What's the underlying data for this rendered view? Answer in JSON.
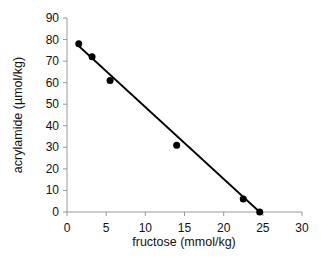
{
  "chart_data": {
    "type": "scatter",
    "title": "",
    "xlabel": "fructose (mmol/kg)",
    "ylabel": "acrylamide (µmol/kg)",
    "xlim": [
      0,
      30
    ],
    "ylim": [
      0,
      90
    ],
    "xticks": [
      0,
      5,
      10,
      15,
      20,
      25,
      30
    ],
    "yticks": [
      0,
      10,
      20,
      30,
      40,
      50,
      60,
      70,
      80,
      90
    ],
    "grid": false,
    "legend": null,
    "series": [
      {
        "name": "data",
        "points": [
          {
            "x": 1.5,
            "y": 78
          },
          {
            "x": 3.2,
            "y": 72
          },
          {
            "x": 5.5,
            "y": 61
          },
          {
            "x": 14.0,
            "y": 31
          },
          {
            "x": 22.5,
            "y": 6
          },
          {
            "x": 24.6,
            "y": 0
          }
        ]
      }
    ],
    "trendline": {
      "type": "linear",
      "x": [
        1.5,
        24.6
      ],
      "y": [
        77,
        0
      ]
    },
    "colors": {
      "points": "#000000",
      "line": "#000000",
      "axis": "#999999"
    }
  }
}
